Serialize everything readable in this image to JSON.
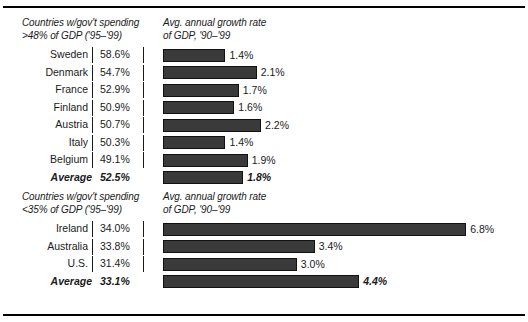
{
  "chart_data": {
    "type": "bar",
    "title": "",
    "orientation": "horizontal",
    "xlabel": "",
    "ylabel": "",
    "grid": false,
    "legend": "none",
    "px_per_percent": 44.6,
    "panels": [
      {
        "header_left": "Countries w/gov't spending\n>48% of GDP ('95–'99)",
        "header_right": "Avg. annual growth rate\nof GDP, '90–'99",
        "categories": [
          "Sweden",
          "Denmark",
          "France",
          "Finland",
          "Austria",
          "Italy",
          "Belgium"
        ],
        "spending_values": [
          "58.6%",
          "54.7%",
          "52.9%",
          "50.9%",
          "50.7%",
          "50.3%",
          "49.1%"
        ],
        "growth_values": [
          1.4,
          2.1,
          1.7,
          1.6,
          2.2,
          1.4,
          1.9
        ],
        "growth_labels": [
          "1.4%",
          "2.1%",
          "1.7%",
          "1.6%",
          "2.2%",
          "1.4%",
          "1.9%"
        ],
        "average": {
          "name": "Average",
          "spending_value": "52.5%",
          "growth_value": 1.8,
          "growth_label": "1.8%"
        }
      },
      {
        "header_left": "Countries w/gov't spending\n<35% of GDP ('95–'99)",
        "header_right": "Avg. annual growth rate\nof GDP, '90–'99",
        "categories": [
          "Ireland",
          "Australia",
          "U.S."
        ],
        "spending_values": [
          "34.0%",
          "33.8%",
          "31.4%"
        ],
        "growth_values": [
          6.8,
          3.4,
          3.0
        ],
        "growth_labels": [
          "6.8%",
          "3.4%",
          "3.0%"
        ],
        "average": {
          "name": "Average",
          "spending_value": "33.1%",
          "growth_value": 4.4,
          "growth_label": "4.4%"
        }
      }
    ],
    "colors": {
      "bar_fill": "#3a3a3a",
      "bar_stroke": "#111111",
      "text": "#1a1a1a",
      "rule": "#000000",
      "background": "#ffffff"
    }
  }
}
